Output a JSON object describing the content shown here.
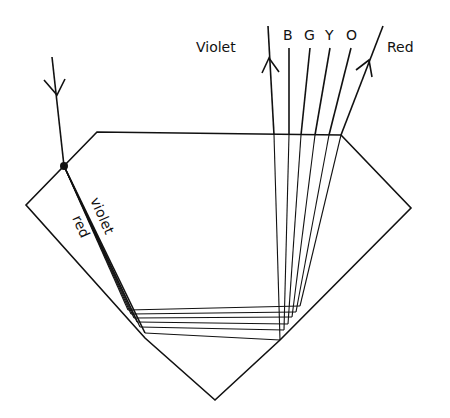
{
  "diagram": {
    "labels": {
      "violet_exit": "Violet",
      "blue": "B",
      "green": "G",
      "yellow": "Y",
      "orange": "O",
      "red_exit": "Red",
      "violet_internal": "violet",
      "red_internal": "red"
    },
    "colors": {
      "line": "#111111",
      "background": "#ffffff"
    }
  }
}
